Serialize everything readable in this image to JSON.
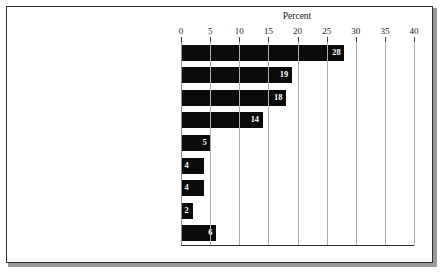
{
  "figure": {
    "axis_title": "Percent"
  },
  "chart_data": {
    "type": "bar",
    "orientation": "horizontal",
    "title": "",
    "xlabel": "Percent",
    "ylabel": "",
    "xlim": [
      0,
      40
    ],
    "xticks": [
      0,
      5,
      10,
      15,
      20,
      25,
      30,
      35,
      40
    ],
    "xtick_labels": [
      "0",
      "5",
      "10",
      "15",
      "20",
      "25",
      "30",
      "35",
      "40"
    ],
    "grid": true,
    "legend": false,
    "bar_color": "#0b0b0b",
    "categories": [
      "Loading/unloading truck, trailer, railcar,\nor other vehicle",
      "Moving stock to or from storage area",
      "Selecting or picking items",
      "Stacking or placing stock",
      "Repairing, adjusting, cleaning, or\nmaintaining equipment or machinery",
      "Packing or wrapping items for shipping",
      "Doing cleanup work",
      "Inspecting or labeling stock,\nor doing inventory",
      "Other"
    ],
    "values": [
      28,
      19,
      18,
      14,
      5,
      4,
      4,
      2,
      6
    ],
    "value_labels": [
      "28",
      "19",
      "18",
      "14",
      "5",
      "4",
      "4",
      "2",
      "6"
    ]
  }
}
